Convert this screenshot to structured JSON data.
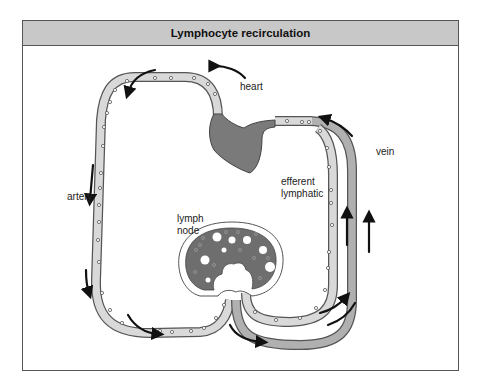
{
  "diagram": {
    "title": "Lymphocyte recirculation",
    "labels": {
      "heart": "heart",
      "artery": "artery",
      "vein": "vein",
      "efferent_line1": "efferent",
      "efferent_line2": "lymphatic",
      "lymph_line1": "lymph",
      "lymph_line2": "node"
    },
    "colors": {
      "header_bg": "#c8c8c8",
      "heart": "#7a7a7a",
      "vessel_light": "#d9d9d9",
      "vein": "#b0b0b0",
      "outline": "#555555",
      "arrow": "#111111"
    }
  }
}
